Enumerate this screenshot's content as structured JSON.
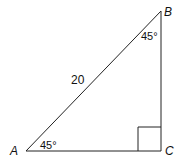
{
  "diagram": {
    "type": "right-triangle",
    "vertices": [
      {
        "name": "A",
        "x": 26,
        "y": 151
      },
      {
        "name": "B",
        "x": 161,
        "y": 11
      },
      {
        "name": "C",
        "x": 161,
        "y": 151
      }
    ],
    "labels": {
      "A": "A",
      "B": "B",
      "C": "C",
      "hypotenuse": "20",
      "angle_A": "45°",
      "angle_B": "45°"
    },
    "right_angle_at": "C",
    "stroke_color": "#222222"
  }
}
